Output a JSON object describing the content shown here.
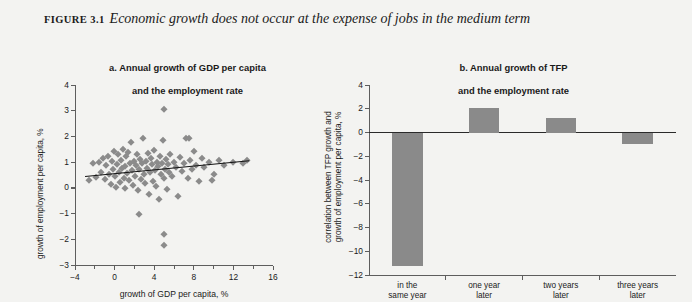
{
  "figure": {
    "label": "FIGURE 3.1",
    "caption": "Economic growth does not occur at the expense of jobs in the medium term",
    "background_color": "#f3f3f1",
    "marker_color": "#8b8b8b",
    "bar_color": "#8a8a8a",
    "axis_color": "#5d5d5d",
    "trendline_color": "#131313"
  },
  "panel_a": {
    "heading": "a.  Annual growth of GDP per capita\nand the employment rate",
    "heading_line1": "a.  Annual growth of GDP per capita",
    "heading_line2": "and the employment rate"
  },
  "panel_b": {
    "heading": "b.  Annual growth of  TFP\nand the employment rate",
    "heading_line1": "b.  Annual growth of  TFP",
    "heading_line2": "and the employment rate"
  },
  "chart_data": [
    {
      "type": "scatter",
      "panel": "a",
      "title": "a. Annual growth of GDP per capita and the employment rate",
      "xlabel": "growth of GDP per capita, %",
      "ylabel": "growth of employment per capita, %",
      "xlim": [
        -4,
        16
      ],
      "ylim": [
        -3,
        4
      ],
      "xticks": [
        -4,
        0,
        4,
        8,
        12,
        16
      ],
      "yticks": [
        -3,
        -2,
        -1,
        0,
        1,
        2,
        3,
        4
      ],
      "xticklabels": [
        "−4",
        "0",
        "4",
        "8",
        "12",
        "16"
      ],
      "yticklabels": [
        "−3",
        "−2",
        "−1",
        "0",
        "1",
        "2",
        "3",
        "4"
      ],
      "grid": false,
      "legend": null,
      "marker": "diamond",
      "trendline": {
        "x0": -3.0,
        "y0": 0.45,
        "x1": 13.6,
        "y1": 1.06,
        "slope": 0.037
      },
      "points": [
        [
          -2.6,
          0.3
        ],
        [
          -2.2,
          0.95
        ],
        [
          -1.9,
          0.42
        ],
        [
          -1.6,
          1.02
        ],
        [
          -1.4,
          0.62
        ],
        [
          -1.2,
          1.18
        ],
        [
          -1.0,
          0.35
        ],
        [
          -0.9,
          0.88
        ],
        [
          -0.7,
          1.25
        ],
        [
          -0.6,
          0.55
        ],
        [
          -0.4,
          0.15
        ],
        [
          -0.3,
          1.05
        ],
        [
          -0.2,
          0.72
        ],
        [
          -0.1,
          1.42
        ],
        [
          0.0,
          0.48
        ],
        [
          0.1,
          0.05
        ],
        [
          0.2,
          0.92
        ],
        [
          0.3,
          1.3
        ],
        [
          0.4,
          0.62
        ],
        [
          0.5,
          0.22
        ],
        [
          0.6,
          1.1
        ],
        [
          0.7,
          0.78
        ],
        [
          0.8,
          1.52
        ],
        [
          0.9,
          0.38
        ],
        [
          1.0,
          0.0
        ],
        [
          1.1,
          0.85
        ],
        [
          1.2,
          1.22
        ],
        [
          1.3,
          0.58
        ],
        [
          1.4,
          1.4
        ],
        [
          1.5,
          0.3
        ],
        [
          1.6,
          0.95
        ],
        [
          1.7,
          1.78
        ],
        [
          1.8,
          0.68
        ],
        [
          1.9,
          0.12
        ],
        [
          2.0,
          1.05
        ],
        [
          2.1,
          0.45
        ],
        [
          2.2,
          0.88
        ],
        [
          2.3,
          1.3
        ],
        [
          2.4,
          -0.1
        ],
        [
          2.5,
          0.72
        ],
        [
          2.6,
          1.12
        ],
        [
          2.7,
          0.35
        ],
        [
          2.8,
          0.95
        ],
        [
          2.9,
          1.95
        ],
        [
          3.0,
          0.52
        ],
        [
          3.1,
          0.18
        ],
        [
          3.2,
          1.05
        ],
        [
          3.3,
          0.78
        ],
        [
          3.4,
          1.35
        ],
        [
          3.5,
          -0.25
        ],
        [
          3.6,
          0.62
        ],
        [
          3.7,
          1.18
        ],
        [
          3.8,
          0.92
        ],
        [
          3.9,
          0.28
        ],
        [
          4.0,
          1.48
        ],
        [
          4.1,
          0.7
        ],
        [
          4.2,
          0.08
        ],
        [
          4.3,
          1.02
        ],
        [
          4.4,
          0.85
        ],
        [
          4.5,
          -0.42
        ],
        [
          4.6,
          1.25
        ],
        [
          4.7,
          0.55
        ],
        [
          4.8,
          0.98
        ],
        [
          4.9,
          1.88
        ],
        [
          5.0,
          0.38
        ],
        [
          5.1,
          0.75
        ],
        [
          5.2,
          1.12
        ],
        [
          5.3,
          -0.05
        ],
        [
          5.4,
          0.92
        ],
        [
          5.5,
          0.6
        ],
        [
          5.6,
          1.3
        ],
        [
          5.8,
          0.45
        ],
        [
          6.0,
          1.0
        ],
        [
          6.2,
          0.8
        ],
        [
          6.4,
          -0.3
        ],
        [
          6.6,
          1.2
        ],
        [
          6.8,
          0.65
        ],
        [
          7.0,
          0.95
        ],
        [
          7.2,
          1.92
        ],
        [
          7.4,
          0.4
        ],
        [
          7.6,
          1.08
        ],
        [
          7.8,
          0.72
        ],
        [
          8.0,
          1.45
        ],
        [
          8.2,
          0.9
        ],
        [
          8.5,
          0.25
        ],
        [
          8.8,
          1.15
        ],
        [
          9.0,
          0.82
        ],
        [
          9.5,
          1.02
        ],
        [
          10.0,
          0.55
        ],
        [
          10.5,
          1.1
        ],
        [
          11.0,
          0.88
        ],
        [
          12.0,
          1.0
        ],
        [
          13.0,
          0.95
        ],
        [
          13.4,
          1.08
        ],
        [
          5.0,
          3.05
        ],
        [
          7.5,
          1.95
        ],
        [
          9.8,
          0.3
        ],
        [
          2.5,
          -1.02
        ],
        [
          5.0,
          -1.8
        ],
        [
          5.0,
          -2.22
        ]
      ]
    },
    {
      "type": "bar",
      "panel": "b",
      "title": "b. Annual growth of TFP and the employment rate",
      "xlabel": "",
      "ylabel": "correlation between TFP growth and growth of employment per capita, %",
      "categories": [
        "in the\nsame year",
        "one year\nlater",
        "two years\nlater",
        "three years\nlater"
      ],
      "category_labels": [
        {
          "line1": "in the",
          "line2": "same year"
        },
        {
          "line1": "one year",
          "line2": "later"
        },
        {
          "line1": "two years",
          "line2": "later"
        },
        {
          "line1": "three years",
          "line2": "later"
        }
      ],
      "values": [
        -11.2,
        2.1,
        1.2,
        -1.0
      ],
      "ylim": [
        -12,
        4
      ],
      "yticks": [
        -12,
        -10,
        -8,
        -6,
        -4,
        -2,
        0,
        2,
        4
      ],
      "yticklabels": [
        "−12",
        "−10",
        "−8",
        "−6",
        "−4",
        "−2",
        "0",
        "2",
        "4"
      ],
      "grid": false,
      "legend": null
    }
  ]
}
